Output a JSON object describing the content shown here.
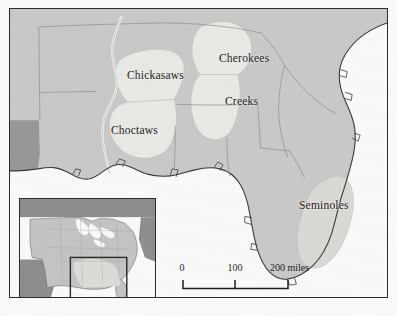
{
  "figure": {
    "kind": "historical-map",
    "region": "Southeastern United States"
  },
  "colors": {
    "land": "#c9c9c7",
    "tribal_land": "#e9e9e6",
    "water": "#fafaf8",
    "dark_territory": "#989896",
    "frame": "#2b2b2b",
    "border_line": "#8f8f8d",
    "coastline": "#3a3a38",
    "label_text": "#1d1d1d",
    "inset_land": "#c4c4c2",
    "inset_dark": "#8e8e8c",
    "inset_water": "#fafaf8"
  },
  "labels": [
    {
      "name": "chickasaws",
      "text": "Chickasaws",
      "x": 117,
      "y": 60
    },
    {
      "name": "choctaws",
      "text": "Choctaws",
      "x": 101,
      "y": 115
    },
    {
      "name": "cherokees",
      "text": "Cherokees",
      "x": 209,
      "y": 43
    },
    {
      "name": "creeks",
      "text": "Creeks",
      "x": 215,
      "y": 86
    },
    {
      "name": "seminoles",
      "text": "Seminoles",
      "x": 309,
      "y": 201
    }
  ],
  "scale_bar": {
    "unit_label": "200 miles",
    "ticks": [
      "0",
      "100",
      "200 miles"
    ],
    "tick_values": [
      0,
      100,
      200
    ],
    "length_px": 106,
    "segments": 2
  },
  "inset": {
    "name": "united-states-locator",
    "description": "United States locator map with detail-area rectangle over the Southeast"
  }
}
